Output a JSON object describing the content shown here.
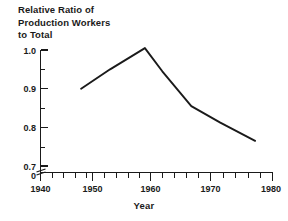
{
  "figure": {
    "title_lines": [
      "Relative Ratio of",
      "Production Workers",
      "to Total"
    ],
    "xlabel": "Year",
    "line_color": "#1a1a1a",
    "background_color": "#ffffff"
  },
  "chart_data": {
    "type": "line",
    "title": "Relative Ratio of Production Workers to Total",
    "xlabel": "Year",
    "ylabel": "",
    "xlim": [
      1940,
      1980
    ],
    "ylim": [
      0.655,
      1.03
    ],
    "grid": false,
    "legend": null,
    "axis_break": true,
    "x_ticks_major": [
      1940,
      1950,
      1960,
      1970,
      1980
    ],
    "x_tick_labels": [
      "1940",
      "1950",
      "1960",
      "1970",
      "1980"
    ],
    "x_ticks_minor_step": 2,
    "y_ticks_major": [
      0.7,
      0.8,
      0.9,
      1.0
    ],
    "y_tick_labels": [
      "0.7",
      "0.8",
      "0.9",
      "1.0"
    ],
    "y_origin_label": "0",
    "y_ticks_minor": [
      0.75,
      0.85,
      0.95
    ],
    "series": [
      {
        "name": "Relative ratio of production workers to total",
        "x": [
          1947,
          1952,
          1958,
          1961,
          1966,
          1971,
          1977
        ],
        "y": [
          0.9,
          0.95,
          1.005,
          0.945,
          0.855,
          0.812,
          0.765
        ]
      }
    ]
  },
  "ticks": {
    "y": [
      {
        "label": "1.0",
        "value": 1.0,
        "py": 50
      },
      {
        "label": "0.9",
        "value": 0.9,
        "py": 88.5
      },
      {
        "label": "0.8",
        "value": 0.8,
        "py": 127.5
      },
      {
        "label": "0.7",
        "value": 0.7,
        "py": 166
      }
    ],
    "y_minor_py": [
      69,
      108,
      147
    ],
    "y_zero_label": "0",
    "x": [
      {
        "label": "1940",
        "value": 1940,
        "px": 40.5
      },
      {
        "label": "1950",
        "value": 1950,
        "px": 92.5
      },
      {
        "label": "1960",
        "value": 1960,
        "px": 150.5
      },
      {
        "label": "1970",
        "value": 1970,
        "px": 210.5
      },
      {
        "label": "1980",
        "value": 1980,
        "px": 272.5
      }
    ]
  }
}
